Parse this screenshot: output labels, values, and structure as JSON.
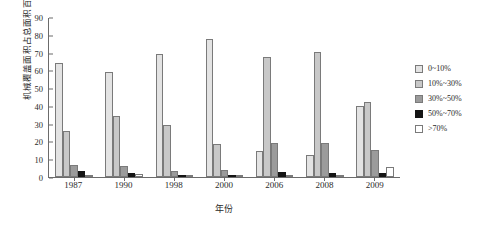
{
  "chart_data": {
    "type": "bar",
    "title": "",
    "xlabel": "年份",
    "ylabel": "机械覆盖面积占总面积百分比(%)",
    "ylim": [
      0,
      90
    ],
    "yticks": [
      0,
      10,
      20,
      30,
      40,
      50,
      60,
      70,
      80,
      90
    ],
    "grid": false,
    "legend_position": "right",
    "categories": [
      "1987",
      "1990",
      "1998",
      "2000",
      "2006",
      "2008",
      "2009"
    ],
    "series": [
      {
        "name": "0~10%",
        "color": "#e3e3e3",
        "values": [
          64,
          59,
          69,
          77.5,
          14.5,
          12.5,
          40
        ]
      },
      {
        "name": "10%~30%",
        "color": "#c8c8c8",
        "values": [
          26,
          34.5,
          29.5,
          18.5,
          67.5,
          70.5,
          42
        ]
      },
      {
        "name": "30%~50%",
        "color": "#9b9b9b",
        "values": [
          7,
          6,
          3.5,
          4,
          19,
          19,
          15
        ]
      },
      {
        "name": "50%~70%",
        "color": "#151515",
        "values": [
          3.5,
          2.5,
          1,
          0.5,
          3,
          2.5,
          2.5
        ]
      },
      {
        "name": ">70%",
        "color": "#ffffff",
        "values": [
          1,
          1.5,
          0.5,
          0.5,
          0.5,
          0.5,
          5.5
        ]
      }
    ]
  }
}
